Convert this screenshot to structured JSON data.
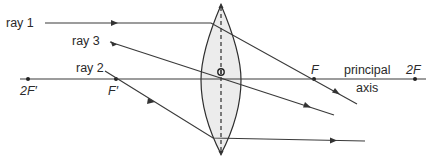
{
  "diagram": {
    "labels": {
      "ray1": "ray 1",
      "ray2": "ray 2",
      "ray3": "ray 3",
      "F": "F",
      "F_prime": "F′",
      "two_F": "2F",
      "two_F_prime": "2F′",
      "principal": "principal",
      "axis": "axis"
    },
    "points": {
      "two_F_prime": {
        "x": 28,
        "y": 79
      },
      "F_prime": {
        "x": 116,
        "y": 79
      },
      "lens_center": {
        "x": 221,
        "y": 79
      },
      "F": {
        "x": 314,
        "y": 79
      },
      "two_F": {
        "x": 415,
        "y": 79
      }
    },
    "lens": {
      "center_x": 221,
      "top_y": 3,
      "bottom_y": 155,
      "half_width": 20
    },
    "colors": {
      "line": "#3a3a3a",
      "lens_fill": "#ececec",
      "text": "#2a2a2a"
    }
  }
}
